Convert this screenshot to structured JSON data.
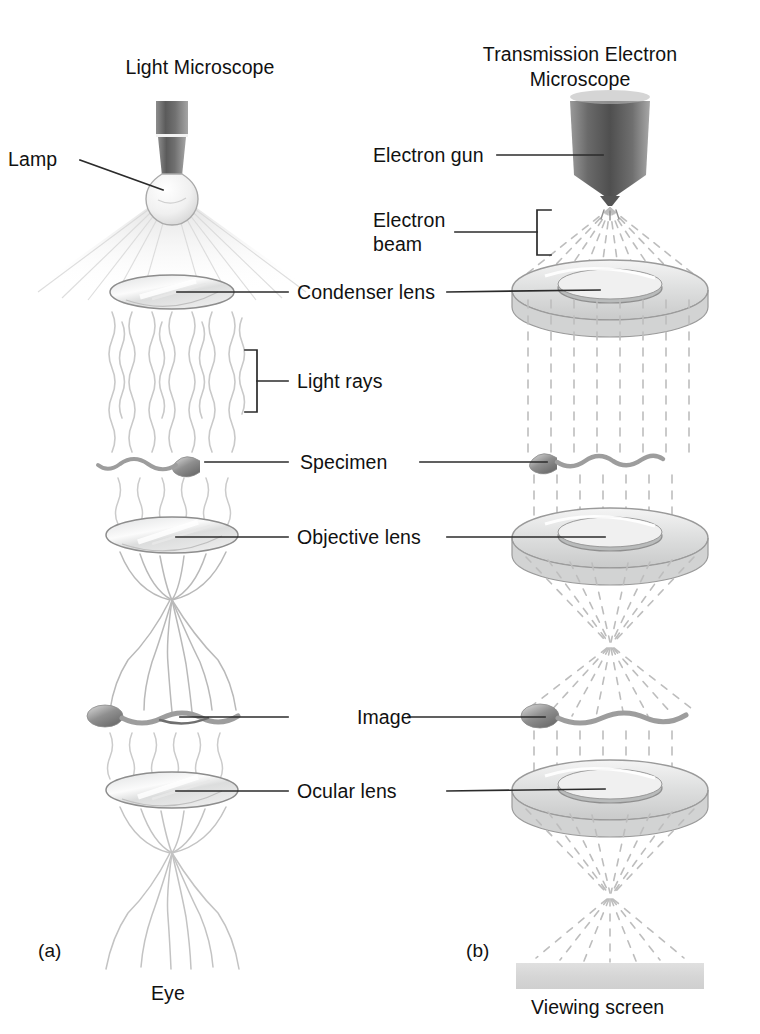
{
  "figure": {
    "panels": [
      {
        "tag": "(a)",
        "title": "Light Microscope",
        "footer": "Eye"
      },
      {
        "tag": "(b)",
        "title_line1": "Transmission Electron",
        "title_line2": "Microscope",
        "footer": "Viewing screen"
      }
    ],
    "labels": {
      "lamp": "Lamp",
      "electron_gun": "Electron gun",
      "electron_beam_line1": "Electron",
      "electron_beam_line2": "beam",
      "condenser_lens": "Condenser lens",
      "light_rays": "Light rays",
      "specimen": "Specimen",
      "objective_lens": "Objective lens",
      "image": "Image",
      "ocular_lens": "Ocular lens"
    },
    "colors": {
      "background": "#ffffff",
      "text": "#111111",
      "leader_line": "#2b2b2b",
      "lens_outline": "#8a8a8a",
      "lens_fill": "#eceded",
      "ray": "#cccccc",
      "beam_dash": "#bdbdbd",
      "gun_dark": "#5a5a5a",
      "screen": "#d9d9d9",
      "specimen": "#9a9a9a"
    }
  }
}
